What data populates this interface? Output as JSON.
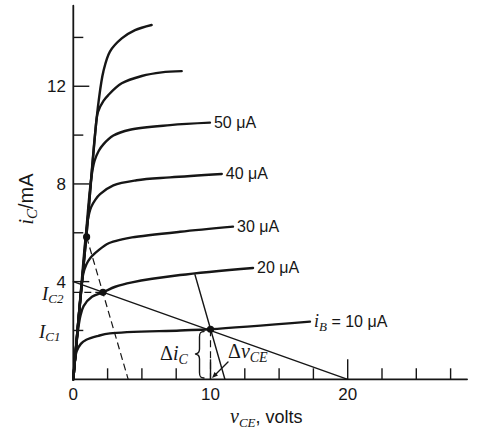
{
  "chart_data": {
    "type": "line",
    "title": "",
    "xlabel": "v_CE, volts",
    "ylabel": "i_C/mA",
    "xlabel_parts": {
      "main": "v",
      "sub": "CE",
      "rest": ", volts"
    },
    "ylabel_parts": {
      "main": "i",
      "sub": "C",
      "rest": "/mA"
    },
    "xlim": [
      0,
      28.7
    ],
    "ylim": [
      0,
      15.3
    ],
    "grid": false,
    "legend": "none (curves labeled inline)",
    "x_ticks": [
      2.5,
      5,
      7.5,
      10,
      12.5,
      15,
      17.5,
      20,
      22.5,
      25,
      27.5
    ],
    "x_major_ticks": [
      10,
      20
    ],
    "x_tick_labels": [
      {
        "value": 0,
        "label": "0"
      },
      {
        "value": 10,
        "label": "10"
      },
      {
        "value": 20,
        "label": "20"
      }
    ],
    "y_ticks": [
      2,
      4,
      6,
      8,
      10,
      12,
      14
    ],
    "y_major_ticks": [
      4,
      8,
      12
    ],
    "y_tick_labels": [
      {
        "value": 4,
        "label": "4"
      },
      {
        "value": 8,
        "label": "8"
      },
      {
        "value": 12,
        "label": "12"
      }
    ],
    "series": [
      {
        "id": "unlabeled-top",
        "label": null,
        "points": [
          [
            0,
            0
          ],
          [
            0.45,
            2.9
          ],
          [
            0.95,
            5.83
          ],
          [
            1.58,
            10.0
          ],
          [
            1.85,
            11.4
          ],
          [
            2.19,
            12.6
          ],
          [
            2.67,
            13.42
          ],
          [
            3.53,
            13.96
          ],
          [
            4.5,
            14.3
          ],
          [
            5.71,
            14.51
          ]
        ]
      },
      {
        "id": "unlabeled-second",
        "label": null,
        "points": [
          [
            0,
            0
          ],
          [
            0.45,
            2.9
          ],
          [
            0.95,
            5.83
          ],
          [
            1.58,
            10.0
          ],
          [
            1.8,
            10.95
          ],
          [
            2.2,
            11.4
          ],
          [
            2.55,
            11.64
          ],
          [
            3.53,
            12.12
          ],
          [
            4.99,
            12.42
          ],
          [
            6.44,
            12.57
          ],
          [
            7.9,
            12.62
          ]
        ]
      },
      {
        "id": "ib-50uA",
        "label": "50 μA",
        "points": [
          [
            0,
            0
          ],
          [
            0.7,
            4.4
          ],
          [
            1.3,
            8.2
          ],
          [
            1.55,
            8.95
          ],
          [
            1.85,
            9.35
          ],
          [
            2.19,
            9.62
          ],
          [
            2.92,
            9.98
          ],
          [
            4.13,
            10.22
          ],
          [
            7.05,
            10.41
          ],
          [
            9.96,
            10.51
          ]
        ]
      },
      {
        "id": "ib-40uA",
        "label": "40 μA",
        "points": [
          [
            0,
            0
          ],
          [
            0.55,
            3.6
          ],
          [
            1.05,
            6.5
          ],
          [
            1.3,
            7.05
          ],
          [
            1.6,
            7.35
          ],
          [
            1.95,
            7.58
          ],
          [
            2.92,
            7.94
          ],
          [
            4.62,
            8.15
          ],
          [
            7.05,
            8.27
          ],
          [
            10.82,
            8.41
          ]
        ]
      },
      {
        "id": "ib-30uA",
        "label": "30 μA",
        "points": [
          [
            0,
            0
          ],
          [
            0.4,
            2.6
          ],
          [
            0.72,
            4.3
          ],
          [
            0.95,
            4.7
          ],
          [
            1.24,
            4.97
          ],
          [
            1.85,
            5.29
          ],
          [
            2.58,
            5.57
          ],
          [
            3.55,
            5.73
          ],
          [
            4.28,
            5.81
          ],
          [
            7.78,
            6.04
          ],
          [
            11.64,
            6.25
          ]
        ]
      },
      {
        "id": "ib-20uA",
        "label": "20 μA",
        "points": [
          [
            0,
            0
          ],
          [
            0.3,
            1.8
          ],
          [
            0.5,
            2.55
          ],
          [
            0.75,
            3.0
          ],
          [
            1.36,
            3.38
          ],
          [
            2.16,
            3.56
          ],
          [
            3.06,
            3.79
          ],
          [
            4.28,
            3.97
          ],
          [
            7.78,
            4.27
          ],
          [
            13.1,
            4.56
          ]
        ]
      },
      {
        "id": "ib-10uA",
        "label": null,
        "label_parts": {
          "main": "i",
          "sub": "B",
          "rest": " = 10 μA"
        },
        "points": [
          [
            0,
            0
          ],
          [
            0.08,
            0.6
          ],
          [
            0.25,
            1.15
          ],
          [
            0.55,
            1.45
          ],
          [
            0.95,
            1.62
          ],
          [
            1.82,
            1.78
          ],
          [
            2.67,
            1.88
          ],
          [
            7.78,
            2.0
          ],
          [
            10,
            2.05
          ],
          [
            17.25,
            2.36
          ]
        ]
      }
    ],
    "load_line": {
      "points": [
        [
          0,
          4
        ],
        [
          20,
          0
        ]
      ]
    },
    "dashed_lines": [
      {
        "id": "sloped-dashed-line",
        "points": [
          [
            0.97,
            5.83
          ],
          [
            4.0,
            0
          ]
        ]
      },
      {
        "id": "ic2-dashed-level",
        "points": [
          [
            0,
            3.56
          ],
          [
            2.16,
            3.56
          ]
        ]
      },
      {
        "id": "q-vertical-dashed",
        "points": [
          [
            10,
            2.05
          ],
          [
            10,
            0
          ]
        ]
      }
    ],
    "delta_line": {
      "points": [
        [
          8.87,
          4.28
        ],
        [
          11.05,
          0
        ]
      ]
    },
    "marked_points": [
      {
        "id": "upper-dot",
        "x": 0.97,
        "y": 5.83
      },
      {
        "id": "q2-point",
        "x": 2.16,
        "y": 3.56
      },
      {
        "id": "q1-point",
        "x": 10,
        "y": 2.05
      }
    ],
    "annotations": {
      "ic2": {
        "main": "I",
        "sub": "C2",
        "value": 3.56
      },
      "ic1": {
        "main": "I",
        "sub": "C1",
        "value": 2.05
      },
      "delta_ic": {
        "symbol": "Δ",
        "main": "i",
        "sub": "C"
      },
      "delta_vce": {
        "symbol": "Δ",
        "main": "v",
        "sub": "CE"
      }
    }
  }
}
